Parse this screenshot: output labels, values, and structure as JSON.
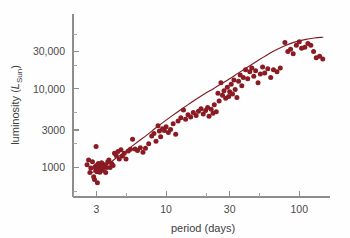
{
  "figure": {
    "background_color": "#fefefe",
    "axis_color": "#8d8d8d",
    "marker_color": "#8a1b23",
    "curve_color": "#7d1b22"
  },
  "axes": {
    "x_title": "period (days)",
    "y_title_prefix": "luminosity (",
    "y_title_symbol": "L",
    "y_title_subscript": "Sun",
    "y_title_suffix": ")",
    "x_tick_labels": [
      "3",
      "10",
      "30",
      "100"
    ],
    "y_tick_labels": [
      "1000",
      "3000",
      "10,000",
      "30,000"
    ]
  },
  "chart_data": {
    "type": "scatter",
    "title": "",
    "xlabel": "period (days)",
    "ylabel": "luminosity (L_Sun)",
    "xscale": "log",
    "yscale": "log",
    "xlim": [
      2.0,
      170
    ],
    "ylim": [
      420,
      90000
    ],
    "grid": false,
    "legend": null,
    "x_ticks": [
      3,
      10,
      30,
      100
    ],
    "x_tick_labels": [
      "3",
      "10",
      "30",
      "100"
    ],
    "y_ticks": [
      1000,
      3000,
      10000,
      30000
    ],
    "y_tick_labels": [
      "1000",
      "3000",
      "10,000",
      "30,000"
    ],
    "x_minor_ticks": [
      2,
      5,
      20,
      50,
      200
    ],
    "y_minor_ticks": [
      500,
      2000,
      5000,
      20000,
      50000
    ],
    "series": [
      {
        "name": "Cepheid variables",
        "type": "scatter",
        "marker": "circle",
        "color": "#8a1b23",
        "points": [
          [
            2.55,
            1080
          ],
          [
            2.62,
            1240
          ],
          [
            2.68,
            860
          ],
          [
            2.72,
            980
          ],
          [
            2.8,
            1180
          ],
          [
            2.86,
            760
          ],
          [
            2.9,
            700
          ],
          [
            2.93,
            1020
          ],
          [
            2.96,
            930
          ],
          [
            2.98,
            1850
          ],
          [
            3.0,
            1060
          ],
          [
            3.02,
            880
          ],
          [
            3.05,
            640
          ],
          [
            3.08,
            1000
          ],
          [
            3.1,
            1120
          ],
          [
            3.14,
            950
          ],
          [
            3.18,
            870
          ],
          [
            3.22,
            1040
          ],
          [
            3.28,
            1150
          ],
          [
            3.33,
            920
          ],
          [
            3.4,
            1000
          ],
          [
            3.46,
            1080
          ],
          [
            3.52,
            860
          ],
          [
            3.58,
            1000
          ],
          [
            3.65,
            1180
          ],
          [
            3.72,
            1240
          ],
          [
            3.8,
            1000
          ],
          [
            3.9,
            1120
          ],
          [
            4.0,
            1060
          ],
          [
            4.1,
            1520
          ],
          [
            4.22,
            1420
          ],
          [
            4.35,
            1600
          ],
          [
            4.45,
            1280
          ],
          [
            4.58,
            1680
          ],
          [
            4.7,
            1400
          ],
          [
            4.85,
            1520
          ],
          [
            5.0,
            1280
          ],
          [
            5.2,
            1620
          ],
          [
            5.4,
            1700
          ],
          [
            5.6,
            2280
          ],
          [
            5.85,
            1720
          ],
          [
            6.1,
            1640
          ],
          [
            6.4,
            1780
          ],
          [
            6.7,
            1560
          ],
          [
            7.0,
            1760
          ],
          [
            7.4,
            2000
          ],
          [
            7.8,
            2520
          ],
          [
            8.1,
            2700
          ],
          [
            8.4,
            2150
          ],
          [
            8.7,
            3400
          ],
          [
            8.9,
            2900
          ],
          [
            9.1,
            2450
          ],
          [
            9.4,
            3100
          ],
          [
            9.7,
            2950
          ],
          [
            10.0,
            3300
          ],
          [
            10.4,
            2780
          ],
          [
            10.8,
            3050
          ],
          [
            11.3,
            3600
          ],
          [
            11.8,
            2650
          ],
          [
            12.3,
            3900
          ],
          [
            12.9,
            4300
          ],
          [
            13.5,
            5400
          ],
          [
            14.0,
            4100
          ],
          [
            14.6,
            4700
          ],
          [
            15.3,
            4400
          ],
          [
            16.0,
            5000
          ],
          [
            16.8,
            4600
          ],
          [
            17.5,
            5200
          ],
          [
            18.3,
            5600
          ],
          [
            19.0,
            4800
          ],
          [
            19.8,
            5300
          ],
          [
            20.5,
            5800
          ],
          [
            21.0,
            4500
          ],
          [
            21.8,
            5500
          ],
          [
            22.5,
            4900
          ],
          [
            23.0,
            6300
          ],
          [
            23.8,
            5100
          ],
          [
            24.5,
            8800
          ],
          [
            25.0,
            7000
          ],
          [
            25.8,
            12000
          ],
          [
            26.5,
            8300
          ],
          [
            27.2,
            9500
          ],
          [
            28.0,
            7600
          ],
          [
            28.8,
            10500
          ],
          [
            29.5,
            8000
          ],
          [
            30.0,
            9200
          ],
          [
            30.8,
            11500
          ],
          [
            31.5,
            8600
          ],
          [
            32.3,
            13000
          ],
          [
            33.0,
            9800
          ],
          [
            34.0,
            7800
          ],
          [
            35.0,
            12500
          ],
          [
            36.0,
            15000
          ],
          [
            37.0,
            11000
          ],
          [
            38.0,
            14000
          ],
          [
            39.5,
            17500
          ],
          [
            41.0,
            13500
          ],
          [
            42.5,
            16500
          ],
          [
            44.0,
            18500
          ],
          [
            45.5,
            14500
          ],
          [
            47.0,
            17000
          ],
          [
            49.0,
            12000
          ],
          [
            51.0,
            15500
          ],
          [
            53.0,
            19000
          ],
          [
            55.0,
            16000
          ],
          [
            58.0,
            18000
          ],
          [
            61.0,
            14000
          ],
          [
            64.0,
            17500
          ],
          [
            68.0,
            16500
          ],
          [
            72.0,
            18500
          ],
          [
            78.0,
            39000
          ],
          [
            82.0,
            30000
          ],
          [
            86.0,
            32000
          ],
          [
            90.0,
            28000
          ],
          [
            95.0,
            36000
          ],
          [
            100.0,
            40000
          ],
          [
            104.0,
            33000
          ],
          [
            110.0,
            34000
          ],
          [
            116.0,
            38000
          ],
          [
            122.0,
            36000
          ],
          [
            128.0,
            30000
          ],
          [
            134.0,
            25000
          ],
          [
            142.0,
            26000
          ],
          [
            150.0,
            24000
          ]
        ]
      },
      {
        "name": "fitted period-luminosity relation",
        "type": "line",
        "color": "#7d1b22",
        "points": [
          [
            2.6,
            840
          ],
          [
            2.9,
            880
          ],
          [
            3.2,
            950
          ],
          [
            3.6,
            1080
          ],
          [
            4.1,
            1270
          ],
          [
            4.7,
            1500
          ],
          [
            5.4,
            1800
          ],
          [
            6.2,
            2150
          ],
          [
            7.2,
            2600
          ],
          [
            8.3,
            3150
          ],
          [
            9.6,
            3800
          ],
          [
            11.0,
            4500
          ],
          [
            12.8,
            5400
          ],
          [
            14.8,
            6400
          ],
          [
            17.0,
            7500
          ],
          [
            19.5,
            8700
          ],
          [
            22.5,
            10000
          ],
          [
            26.0,
            11600
          ],
          [
            30.0,
            13500
          ],
          [
            35.0,
            16000
          ],
          [
            41.0,
            19000
          ],
          [
            48.0,
            22500
          ],
          [
            56.0,
            26500
          ],
          [
            66.0,
            31000
          ],
          [
            78.0,
            35500
          ],
          [
            92.0,
            39500
          ],
          [
            110.0,
            42500
          ],
          [
            130.0,
            44500
          ],
          [
            150.0,
            45500
          ]
        ]
      }
    ]
  }
}
